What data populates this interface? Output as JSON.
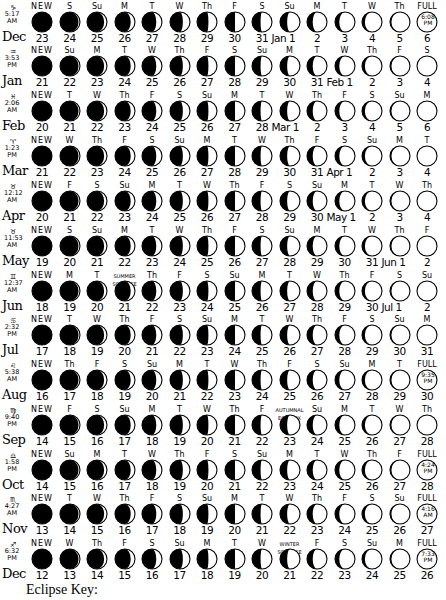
{
  "footer": {
    "label": "Eclipse Key:"
  },
  "rows": [
    {
      "month": "Dec",
      "sign": "♑",
      "time": [
        "5:17",
        "AM"
      ],
      "start_dow": "NEW",
      "dates": [
        "23",
        "24",
        "25",
        "26",
        "27",
        "28",
        "29",
        "30",
        "31",
        "Jan 1",
        "2",
        "3",
        "4",
        "5",
        "6"
      ],
      "dows": [
        "NEW",
        "S",
        "Su",
        "M",
        "T",
        "W",
        "Th",
        "F",
        "S",
        "Su",
        "M",
        "T",
        "W",
        "Th",
        "FULL"
      ],
      "full": {
        "time": "6:08",
        "ampm": "PM"
      },
      "phase_offset": 0
    },
    {
      "month": "Jan",
      "sign": "♒",
      "time": [
        "3:53",
        "PM"
      ],
      "dates": [
        "21",
        "22",
        "23",
        "24",
        "25",
        "26",
        "27",
        "28",
        "29",
        "30",
        "31",
        "Feb 1",
        "2",
        "3",
        "4"
      ],
      "dows": [
        "NEW",
        "Su",
        "M",
        "T",
        "W",
        "Th",
        "F",
        "S",
        "Su",
        "M",
        "T",
        "W",
        "Th",
        "F",
        "S"
      ],
      "phase_offset": 0
    },
    {
      "month": "Feb",
      "sign": "♓",
      "time": [
        "2:06",
        "AM"
      ],
      "dates": [
        "20",
        "21",
        "22",
        "23",
        "24",
        "25",
        "26",
        "27",
        "28",
        "Mar 1",
        "2",
        "3",
        "4",
        "5",
        "6"
      ],
      "dows": [
        "NEW",
        "T",
        "W",
        "Th",
        "F",
        "S",
        "Su",
        "M",
        "T",
        "W",
        "Th",
        "F",
        "S",
        "Su",
        "M"
      ],
      "phase_offset": 0
    },
    {
      "month": "Mar",
      "sign": "♈",
      "time": [
        "1:23",
        "PM"
      ],
      "dates": [
        "21",
        "22",
        "23",
        "24",
        "25",
        "26",
        "27",
        "28",
        "29",
        "30",
        "31",
        "Apr 1",
        "2",
        "3",
        "4"
      ],
      "dows": [
        "NEW",
        "W",
        "Th",
        "F",
        "S",
        "Su",
        "M",
        "T",
        "W",
        "Th",
        "F",
        "S",
        "Su",
        "M",
        "T"
      ],
      "phase_offset": 0
    },
    {
      "month": "Apr",
      "sign": "♉",
      "time": [
        "12:12",
        "AM"
      ],
      "dates": [
        "20",
        "21",
        "22",
        "23",
        "24",
        "25",
        "26",
        "27",
        "28",
        "29",
        "30",
        "May 1",
        "2",
        "3",
        "4"
      ],
      "dows": [
        "NEW",
        "F",
        "S",
        "Su",
        "M",
        "T",
        "W",
        "Th",
        "F",
        "S",
        "Su",
        "M",
        "T",
        "W",
        "Th"
      ],
      "phase_offset": 0
    },
    {
      "month": "May",
      "sign": "♉",
      "time": [
        "11:53",
        "AM"
      ],
      "dates": [
        "19",
        "20",
        "21",
        "22",
        "23",
        "24",
        "25",
        "26",
        "27",
        "28",
        "29",
        "30",
        "31",
        "Jun 1",
        "2"
      ],
      "dows": [
        "NEW",
        "S",
        "Su",
        "M",
        "T",
        "W",
        "Th",
        "F",
        "S",
        "Su",
        "M",
        "T",
        "W",
        "Th",
        "F"
      ],
      "phase_offset": 0
    },
    {
      "month": "Jun",
      "sign": "♊",
      "time": [
        "12:37",
        "AM"
      ],
      "dates": [
        "18",
        "19",
        "20",
        "21",
        "22",
        "23",
        "24",
        "25",
        "26",
        "27",
        "28",
        "29",
        "30",
        "Jul 1",
        "2"
      ],
      "dows": [
        "NEW",
        "M",
        "T",
        "SUMMER SOLSTICE",
        "Th",
        "F",
        "S",
        "Su",
        "M",
        "T",
        "W",
        "Th",
        "F",
        "S",
        "Su"
      ],
      "phase_offset": 0
    },
    {
      "month": "Jul",
      "sign": "♋",
      "time": [
        "2:32",
        "PM"
      ],
      "dates": [
        "17",
        "18",
        "19",
        "20",
        "21",
        "22",
        "23",
        "24",
        "25",
        "26",
        "27",
        "28",
        "29",
        "30",
        "31"
      ],
      "dows": [
        "NEW",
        "T",
        "W",
        "Th",
        "F",
        "S",
        "Su",
        "M",
        "T",
        "W",
        "Th",
        "F",
        "S",
        "Su",
        "M"
      ],
      "phase_offset": 0
    },
    {
      "month": "Aug",
      "sign": "♌",
      "time": [
        "5:38",
        "AM"
      ],
      "dates": [
        "16",
        "17",
        "18",
        "19",
        "20",
        "21",
        "22",
        "23",
        "24",
        "25",
        "26",
        "27",
        "28",
        "29",
        "30"
      ],
      "dows": [
        "NEW",
        "Th",
        "F",
        "S",
        "Su",
        "M",
        "T",
        "W",
        "Th",
        "F",
        "S",
        "Su",
        "M",
        "T",
        "FULL"
      ],
      "full": {
        "time": "9:35",
        "ampm": "PM"
      },
      "phase_offset": 0
    },
    {
      "month": "Sep",
      "sign": "♍",
      "time": [
        "9:40",
        "PM"
      ],
      "dates": [
        "14",
        "15",
        "16",
        "17",
        "18",
        "19",
        "20",
        "21",
        "22",
        "23",
        "24",
        "25",
        "26",
        "27",
        "28"
      ],
      "dows": [
        "NEW",
        "F",
        "S",
        "Su",
        "M",
        "T",
        "W",
        "Th",
        "F",
        "AUTUMNAL EQUINOX",
        "Su",
        "M",
        "T",
        "W",
        "Th"
      ],
      "phase_offset": 0
    },
    {
      "month": "Oct",
      "sign": "♎",
      "time": [
        "1:58",
        "PM"
      ],
      "dates": [
        "14",
        "15",
        "16",
        "17",
        "18",
        "19",
        "20",
        "21",
        "22",
        "23",
        "24",
        "25",
        "26",
        "27",
        "28"
      ],
      "dows": [
        "NEW",
        "Su",
        "M",
        "T",
        "W",
        "Th",
        "F",
        "S",
        "Su",
        "M",
        "T",
        "W",
        "Th",
        "F",
        "FULL"
      ],
      "full": {
        "time": "4:24",
        "ampm": "PM"
      },
      "phase_offset": 0
    },
    {
      "month": "Nov",
      "sign": "♏",
      "time": [
        "4:27",
        "AM"
      ],
      "dates": [
        "13",
        "14",
        "15",
        "16",
        "17",
        "18",
        "19",
        "20",
        "21",
        "22",
        "23",
        "24",
        "25",
        "26",
        "27"
      ],
      "dows": [
        "NEW",
        "T",
        "W",
        "Th",
        "F",
        "S",
        "Su",
        "M",
        "T",
        "W",
        "Th",
        "F",
        "S",
        "Su",
        "FULL"
      ],
      "full": {
        "time": "4:16",
        "ampm": "AM"
      },
      "phase_offset": 0
    },
    {
      "month": "Dec",
      "sign": "♐",
      "time": [
        "6:32",
        "PM"
      ],
      "dates": [
        "12",
        "13",
        "14",
        "15",
        "16",
        "17",
        "18",
        "19",
        "20",
        "21",
        "22",
        "23",
        "24",
        "25",
        "26"
      ],
      "dows": [
        "NEW",
        "W",
        "Th",
        "F",
        "S",
        "Su",
        "M",
        "T",
        "W",
        "WINTER SOLSTICE",
        "F",
        "S",
        "Su",
        "M",
        "FULL"
      ],
      "full": {
        "time": "7:33",
        "ampm": "PM"
      },
      "phase_offset": 0
    }
  ]
}
